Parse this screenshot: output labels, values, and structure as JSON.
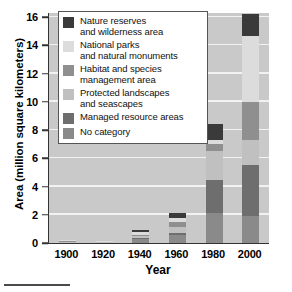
{
  "chart_data": {
    "type": "bar",
    "stacked": true,
    "title": "",
    "xlabel": "Year",
    "ylabel": "Area (million square kilometers)",
    "categories": [
      "1900",
      "1920",
      "1940",
      "1960",
      "1980",
      "2000"
    ],
    "ylim": [
      0,
      16.3
    ],
    "yticks": [
      0,
      2,
      4,
      6,
      8,
      10,
      12,
      14,
      16
    ],
    "ytick_labels": [
      "0",
      "2",
      "4",
      "6",
      "8",
      "10",
      "12",
      "14",
      "16"
    ],
    "grid": "horizontal",
    "legend_position": "upper-left-inside",
    "series": [
      {
        "name": "No category",
        "color": "#8a8a8a",
        "values": [
          0.05,
          0.04,
          0.25,
          0.55,
          2.15,
          1.9
        ]
      },
      {
        "name": "Managed resource areas",
        "color": "#6e6e6e",
        "values": [
          0.0,
          0.0,
          0.1,
          0.15,
          2.3,
          3.6
        ]
      },
      {
        "name": "Protected landscapes and seascapes",
        "color": "#c0c0c0",
        "values": [
          0.05,
          0.05,
          0.15,
          0.45,
          2.1,
          1.8
        ]
      },
      {
        "name": "Habitat and species management area",
        "color": "#8f8f8f",
        "values": [
          0.05,
          0.03,
          0.1,
          0.35,
          0.5,
          2.7
        ]
      },
      {
        "name": "National parks and natural monuments",
        "color": "#dcdcdc",
        "values": [
          0.05,
          0.03,
          0.15,
          0.3,
          0.25,
          4.7
        ]
      },
      {
        "name": "Nature reserves and wilderness area",
        "color": "#3a3a3a",
        "values": [
          0.0,
          0.0,
          0.15,
          0.3,
          1.15,
          1.5
        ]
      }
    ],
    "totals": [
      0.2,
      0.15,
      0.9,
      2.1,
      8.45,
      16.2
    ]
  },
  "legend": {
    "items": [
      {
        "label_line1": "Nature reserves",
        "label_line2": "and wilderness area",
        "color": "#3a3a3a"
      },
      {
        "label_line1": "National parks",
        "label_line2": "and natural monuments",
        "color": "#dcdcdc"
      },
      {
        "label_line1": "Habitat and species",
        "label_line2": "management area",
        "color": "#8f8f8f"
      },
      {
        "label_line1": "Protected landscapes",
        "label_line2": "and seascapes",
        "color": "#c0c0c0"
      },
      {
        "label_line1": "Managed resource areas",
        "label_line2": "",
        "color": "#6e6e6e"
      },
      {
        "label_line1": "No category",
        "label_line2": "",
        "color": "#8a8a8a"
      }
    ]
  },
  "axes": {
    "y_title": "Area (million square kilometers)",
    "x_title": "Year"
  }
}
